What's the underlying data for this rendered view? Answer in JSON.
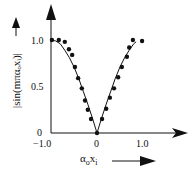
{
  "chart_data": {
    "type": "scatter",
    "title": "",
    "xlabel": "αₒxᵢ",
    "ylabel": "|sin(mπαₒxᵢ)|",
    "xlim": [
      -1.0,
      1.0
    ],
    "ylim": [
      0,
      1.0
    ],
    "grid": false,
    "legend": null,
    "x_ticks": [
      "−1.0",
      "0",
      "1.0"
    ],
    "y_ticks": [
      "0",
      "0.5",
      "1.0"
    ],
    "series": [
      {
        "name": "measured points",
        "style": "filled-circle markers",
        "x": [
          -0.98,
          -0.83,
          -0.7,
          -0.61,
          -0.54,
          -0.48,
          -0.41,
          -0.33,
          -0.26,
          -0.2,
          -0.13,
          0.0,
          0.11,
          0.2,
          0.28,
          0.37,
          0.46,
          0.54,
          0.65,
          0.7,
          0.78,
          0.98
        ],
        "y": [
          1.0,
          1.0,
          0.98,
          0.9,
          0.84,
          0.71,
          0.59,
          0.48,
          0.35,
          0.25,
          0.15,
          0.0,
          0.15,
          0.26,
          0.38,
          0.48,
          0.6,
          0.71,
          0.82,
          0.92,
          1.0,
          0.99
        ]
      },
      {
        "name": "theoretical curve |sin(mπαₒxᵢ)|",
        "style": "solid line",
        "x": [
          -1.0,
          -0.9,
          -0.8,
          -0.7,
          -0.6,
          -0.5,
          -0.4,
          -0.3,
          -0.2,
          -0.1,
          0.0,
          0.1,
          0.2,
          0.3,
          0.4,
          0.5,
          0.6,
          0.7,
          0.8,
          0.85
        ],
        "y": [
          1.0,
          0.99,
          0.96,
          0.89,
          0.81,
          0.71,
          0.59,
          0.45,
          0.31,
          0.16,
          0.0,
          0.16,
          0.31,
          0.45,
          0.59,
          0.71,
          0.81,
          0.89,
          0.96,
          0.98
        ]
      }
    ]
  },
  "labels": {
    "ylabel": "|sin(mπαₒxᵢ)|",
    "xlabel_main": "α",
    "xlabel_sub1": "o",
    "xlabel_x": "x",
    "xlabel_sub2": "i",
    "y_tick_0": "0",
    "y_tick_05": "0.5",
    "y_tick_1": "1.0",
    "x_tick_neg1": "−1.0",
    "x_tick_0": "0",
    "x_tick_1": "1.0"
  },
  "colors": {
    "ink": "#111111",
    "background": "#ffffff"
  }
}
